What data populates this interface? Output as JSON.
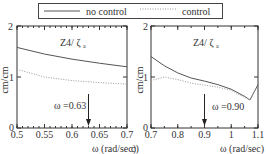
{
  "legend": {
    "items": [
      {
        "label": "no control",
        "style": "solid"
      },
      {
        "label": "control",
        "style": "dotted"
      }
    ]
  },
  "colors": {
    "no_control": "#555555",
    "control": "#999999",
    "axes": "#333333"
  },
  "chart_data": [
    {
      "type": "line",
      "title": "Z4/ ζ a",
      "xlabel": "ω (rad/sec)",
      "ylabel": "cm/cm",
      "xlim": [
        0.5,
        0.7
      ],
      "ylim": [
        0,
        2
      ],
      "xticks": [
        "0.5",
        "0.55",
        "0.6",
        "0.65",
        "0.7"
      ],
      "yticks": [
        "0",
        "1",
        "2"
      ],
      "x": [
        0.5,
        0.55,
        0.6,
        0.65,
        0.7
      ],
      "series": [
        {
          "name": "no control",
          "values": [
            1.58,
            1.45,
            1.35,
            1.27,
            1.2
          ]
        },
        {
          "name": "control",
          "values": [
            1.15,
            1.0,
            0.93,
            0.89,
            0.86
          ]
        }
      ],
      "annotation": {
        "text": "ω =0.63",
        "x": 0.63
      }
    },
    {
      "type": "line",
      "title": "Z4/ ζ a",
      "xlabel": "ω (rad/sec)",
      "ylabel": "cm/cm",
      "xlim": [
        0.7,
        1.1
      ],
      "ylim": [
        0,
        2
      ],
      "xticks": [
        "0.7",
        "0.8",
        "0.9",
        "1",
        "1.1"
      ],
      "yticks": [
        "0",
        "1",
        "2"
      ],
      "x": [
        0.7,
        0.75,
        0.8,
        0.85,
        0.9,
        0.95,
        1.0,
        1.05,
        1.07,
        1.1
      ],
      "series": [
        {
          "name": "no control",
          "values": [
            1.4,
            1.22,
            1.08,
            0.98,
            0.92,
            0.85,
            0.76,
            0.62,
            0.55,
            0.85
          ]
        },
        {
          "name": "control",
          "values": [
            0.93,
            1.0,
            0.95,
            0.88,
            0.84,
            0.8,
            0.74,
            0.6,
            0.55,
            0.85
          ]
        }
      ],
      "annotation": {
        "text": "ω =0.90",
        "x": 0.9
      }
    }
  ],
  "labels": {
    "left_ylabel": "cm/cm",
    "right_ylabel": "cm/cm",
    "left_title": "Z4/ ζ",
    "right_title": "Z4/ ζ",
    "title_sub": "a",
    "left_annotation": "ω =0.63",
    "right_annotation": "ω =0.90",
    "xlabel": "ω  (rad/sec)",
    "stray_right": "c)"
  }
}
